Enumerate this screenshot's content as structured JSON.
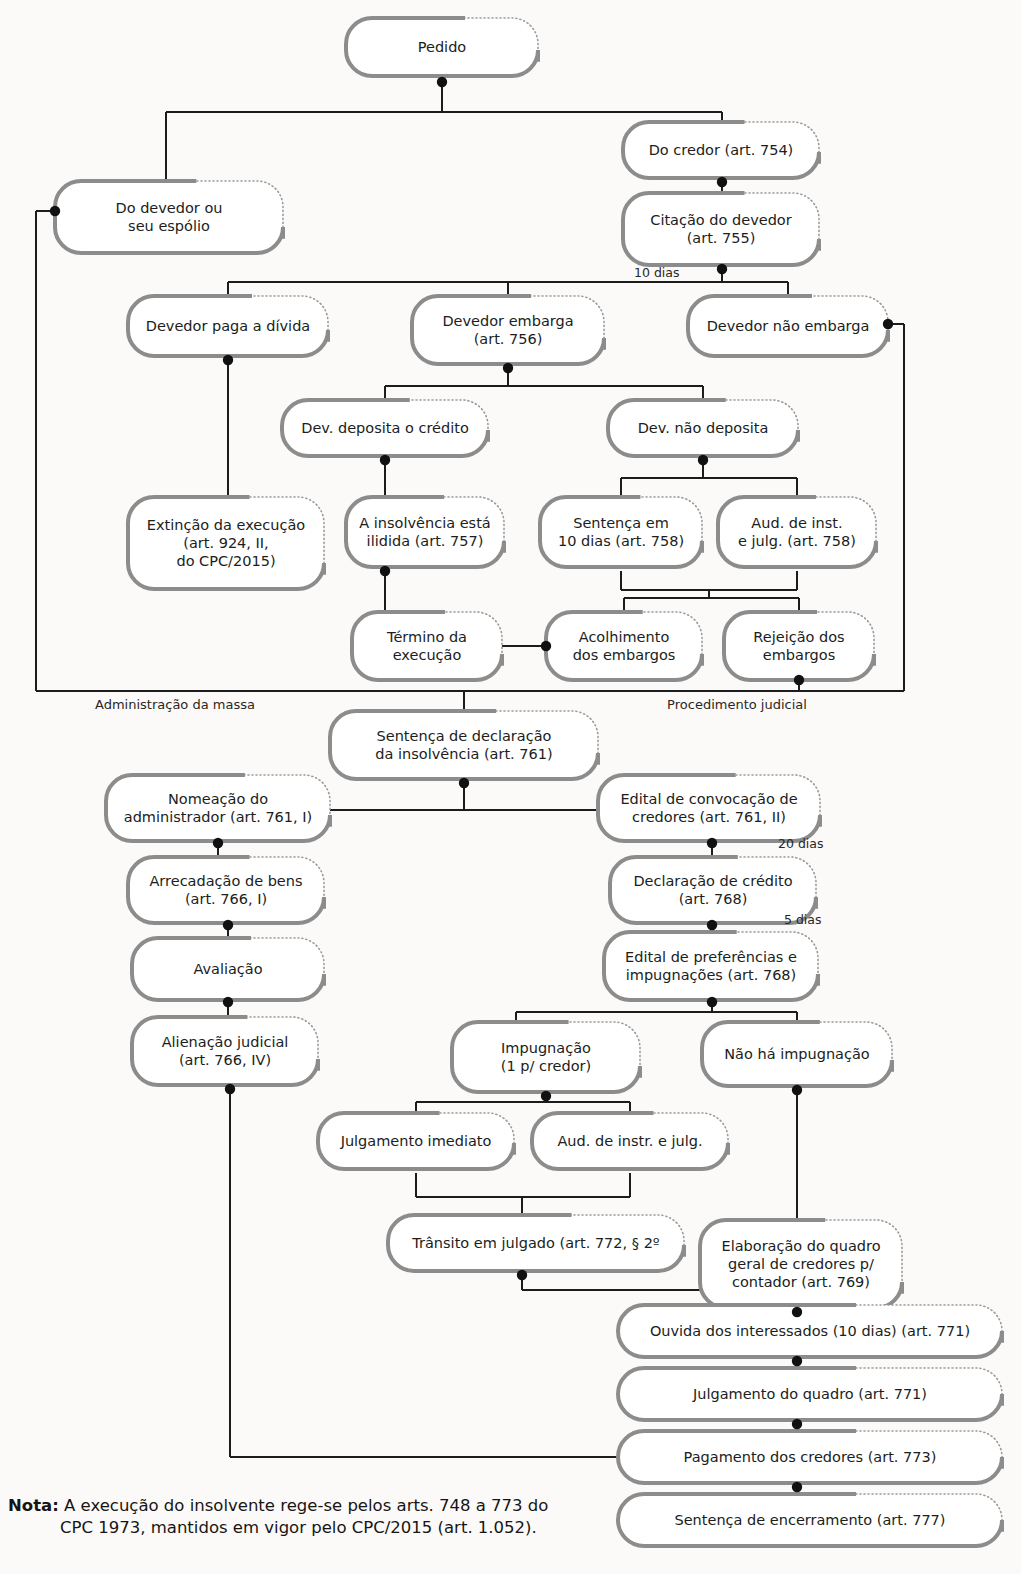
{
  "diagram": {
    "colors": {
      "box_border": "#8c8c8c",
      "box_fill": "#ffffff",
      "connector": "#1c1c1c",
      "dot": "#111111",
      "text": "#201d1c",
      "page_bg": "#fbfaf8"
    },
    "zone_labels": [
      {
        "id": "zone-admin",
        "text": "Administração da massa",
        "x": 175,
        "y": 709
      },
      {
        "id": "zone-judicial",
        "text": "Procedimento judicial",
        "x": 737,
        "y": 709
      }
    ],
    "edge_labels": [
      {
        "id": "edge-10-dias",
        "text": "10 dias",
        "x": 634,
        "y": 277
      },
      {
        "id": "edge-20-dias",
        "text": "20 dias",
        "x": 778,
        "y": 848
      },
      {
        "id": "edge-5-dias",
        "text": "5 dias",
        "x": 784,
        "y": 924
      }
    ],
    "nodes": [
      {
        "id": "pedido",
        "text": [
          "Pedido"
        ],
        "x": 346,
        "y": 18,
        "w": 192,
        "h": 58
      },
      {
        "id": "do-credor",
        "text": [
          "Do credor (art. 754)"
        ],
        "x": 623,
        "y": 122,
        "w": 196,
        "h": 56
      },
      {
        "id": "do-devedor-espolio",
        "text": [
          "Do devedor ou",
          "seu espólio"
        ],
        "x": 55,
        "y": 181,
        "w": 228,
        "h": 72
      },
      {
        "id": "citacao-devedor",
        "text": [
          "Citação do devedor",
          "(art. 755)"
        ],
        "x": 623,
        "y": 193,
        "w": 196,
        "h": 72
      },
      {
        "id": "devedor-paga",
        "text": [
          "Devedor paga a dívida"
        ],
        "x": 128,
        "y": 296,
        "w": 200,
        "h": 60
      },
      {
        "id": "devedor-embarga",
        "text": [
          "Devedor embarga",
          "(art. 756)"
        ],
        "x": 412,
        "y": 296,
        "w": 192,
        "h": 68
      },
      {
        "id": "devedor-nao-embarga",
        "text": [
          "Devedor não embarga"
        ],
        "x": 688,
        "y": 296,
        "w": 200,
        "h": 60
      },
      {
        "id": "dev-deposita",
        "text": [
          "Dev. deposita o crédito"
        ],
        "x": 282,
        "y": 400,
        "w": 206,
        "h": 56
      },
      {
        "id": "dev-nao-deposita",
        "text": [
          "Dev. não deposita"
        ],
        "x": 608,
        "y": 400,
        "w": 190,
        "h": 56
      },
      {
        "id": "extincao-execucao",
        "text": [
          "Extinção da execução",
          "(art. 924, II,",
          "do CPC/2015)"
        ],
        "x": 128,
        "y": 497,
        "w": 196,
        "h": 92
      },
      {
        "id": "insolvencia-ilidida",
        "text": [
          "A insolvência está",
          "ilidida (art. 757)"
        ],
        "x": 346,
        "y": 497,
        "w": 158,
        "h": 70
      },
      {
        "id": "sentenca-10-dias",
        "text": [
          "Sentença em",
          "10 dias (art. 758)"
        ],
        "x": 540,
        "y": 497,
        "w": 162,
        "h": 70
      },
      {
        "id": "aud-inst-julg-758",
        "text": [
          "Aud. de inst.",
          "e julg. (art. 758)"
        ],
        "x": 718,
        "y": 497,
        "w": 158,
        "h": 70
      },
      {
        "id": "termino-execucao",
        "text": [
          "Término da",
          "execução"
        ],
        "x": 352,
        "y": 612,
        "w": 150,
        "h": 68
      },
      {
        "id": "acolhimento-embargos",
        "text": [
          "Acolhimento",
          "dos embargos"
        ],
        "x": 546,
        "y": 612,
        "w": 156,
        "h": 68
      },
      {
        "id": "rejeicao-embargos",
        "text": [
          "Rejeição dos",
          "embargos"
        ],
        "x": 724,
        "y": 612,
        "w": 150,
        "h": 68
      },
      {
        "id": "sentenca-declaracao",
        "text": [
          "Sentença de declaração",
          "da insolvência (art. 761)"
        ],
        "x": 330,
        "y": 711,
        "w": 268,
        "h": 68
      },
      {
        "id": "nomeacao-administrador",
        "text": [
          "Nomeação do",
          "administrador (art. 761, I)"
        ],
        "x": 106,
        "y": 775,
        "w": 224,
        "h": 66
      },
      {
        "id": "edital-convocacao",
        "text": [
          "Edital de convocação de",
          "credores (art. 761, II)"
        ],
        "x": 598,
        "y": 775,
        "w": 222,
        "h": 66
      },
      {
        "id": "arrecadacao-bens",
        "text": [
          "Arrecadação de bens",
          "(art. 766, I)"
        ],
        "x": 128,
        "y": 857,
        "w": 196,
        "h": 66
      },
      {
        "id": "declaracao-credito",
        "text": [
          "Declaração de crédito",
          "(art. 768)"
        ],
        "x": 610,
        "y": 857,
        "w": 206,
        "h": 66
      },
      {
        "id": "avaliacao",
        "text": [
          "Avaliação"
        ],
        "x": 132,
        "y": 938,
        "w": 192,
        "h": 62
      },
      {
        "id": "edital-preferencias",
        "text": [
          "Edital de preferências e",
          "impugnações (art. 768)"
        ],
        "x": 604,
        "y": 932,
        "w": 214,
        "h": 68
      },
      {
        "id": "alienacao-judicial",
        "text": [
          "Alienação judicial",
          "(art. 766, IV)"
        ],
        "x": 132,
        "y": 1017,
        "w": 186,
        "h": 68
      },
      {
        "id": "impugnacao",
        "text": [
          "Impugnação",
          "(1 p/ credor)"
        ],
        "x": 452,
        "y": 1022,
        "w": 188,
        "h": 70
      },
      {
        "id": "nao-ha-impugnacao",
        "text": [
          "Não há impugnação"
        ],
        "x": 702,
        "y": 1022,
        "w": 190,
        "h": 64
      },
      {
        "id": "julgamento-imediato",
        "text": [
          "Julgamento imediato"
        ],
        "x": 318,
        "y": 1113,
        "w": 196,
        "h": 56
      },
      {
        "id": "aud-instr-julg",
        "text": [
          "Aud. de instr. e julg."
        ],
        "x": 532,
        "y": 1113,
        "w": 196,
        "h": 56
      },
      {
        "id": "transito-julgado",
        "text": [
          "Trânsito em julgado (art. 772, § 2º"
        ],
        "x": 388,
        "y": 1215,
        "w": 296,
        "h": 56
      },
      {
        "id": "elaboracao-quadro",
        "text": [
          "Elaboração do quadro",
          "geral de credores p/",
          "contador (art. 769)"
        ],
        "x": 700,
        "y": 1220,
        "w": 202,
        "h": 88
      },
      {
        "id": "ouvida-interessados",
        "text": [
          "Ouvida dos interessados (10 dias) (art. 771)"
        ],
        "x": 618,
        "y": 1305,
        "w": 384,
        "h": 52
      },
      {
        "id": "julgamento-quadro",
        "text": [
          "Julgamento do quadro (art. 771)"
        ],
        "x": 618,
        "y": 1368,
        "w": 384,
        "h": 52
      },
      {
        "id": "pagamento-credores",
        "text": [
          "Pagamento dos credores (art. 773)"
        ],
        "x": 618,
        "y": 1431,
        "w": 384,
        "h": 52
      },
      {
        "id": "sentenca-encerramento",
        "text": [
          "Sentença de encerramento (art. 777)"
        ],
        "x": 618,
        "y": 1494,
        "w": 384,
        "h": 52
      }
    ]
  },
  "note": {
    "prefix": "Nota:",
    "line1": "A execução do insolvente rege-se pelos arts. 748 a 773 do",
    "line2": "CPC 1973, mantidos em vigor pelo CPC/2015 (art. 1.052)."
  }
}
